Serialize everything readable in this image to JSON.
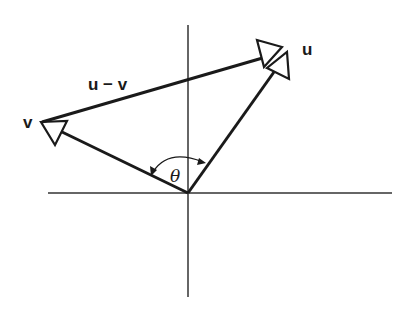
{
  "diagram": {
    "type": "vector-diagram",
    "labels": {
      "u": "u",
      "v": "v",
      "u_minus_v": "u − v",
      "theta": "θ"
    },
    "colors": {
      "stroke": "#1a1a1a",
      "axis": "#333333",
      "background": "#ffffff"
    },
    "points": {
      "origin": [
        188,
        193
      ],
      "u_tip": [
        267,
        64
      ],
      "v_tip": [
        42,
        122
      ]
    },
    "axes": {
      "horizontal": {
        "x1": 48,
        "x2": 392,
        "y": 193
      },
      "vertical": {
        "x": 188,
        "y1": 25,
        "y2": 297
      }
    }
  }
}
